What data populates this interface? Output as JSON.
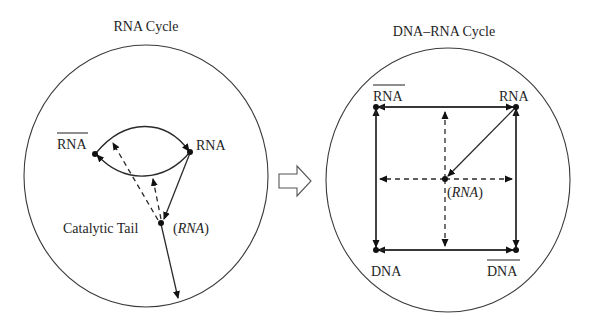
{
  "left_panel": {
    "title": "RNA Cycle",
    "nodes": {
      "rna_bar": "RNA",
      "rna": "RNA",
      "tail": "Catalytic Tail",
      "tail_paren_open": "(",
      "tail_italic": "RNA",
      "tail_paren_close": ")"
    }
  },
  "transition_arrow": {
    "icon": "hollow-right-arrow-icon"
  },
  "right_panel": {
    "title": "DNA–RNA Cycle",
    "nodes": {
      "rna_bar": "RNA",
      "rna": "RNA",
      "dna": "DNA",
      "dna_bar": "DNA",
      "center_paren_open": "(",
      "center_italic": "RNA",
      "center_paren_close": ")"
    }
  },
  "colors": {
    "ink": "#1e1e1e",
    "background": "#ffffff"
  }
}
